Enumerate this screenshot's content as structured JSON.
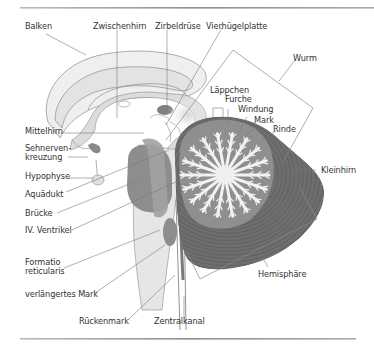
{
  "figure": {
    "type": "anatomical-diagram",
    "colors": {
      "line": "#777777",
      "text": "#333333",
      "rule": "#999999",
      "light_gray": "#e4e4e4",
      "mid_gray": "#c8c8c8",
      "dark_gray": "#8a8a8a",
      "cerebellum_dark": "#6b6b6b",
      "cerebellum_white": "#f0f0f0"
    },
    "labels": {
      "balken": "Balken",
      "zwischenhirn": "Zwischenhirn",
      "zirbeldruese": "Zirbeldrüse",
      "vierhuegelplatte": "Vierhügelplatte",
      "wurm": "Wurm",
      "laeppchen": "Läppchen",
      "furche": "Furche",
      "windung": "Windung",
      "mark_cerebellum": "Mark",
      "rinde": "Rinde",
      "kleinhirn": "Kleinhirn",
      "mittelhirn": "Mittelhirn",
      "sehnervenkreuzung_1": "Sehnerven-",
      "sehnervenkreuzung_2": "kreuzung",
      "hypophyse": "Hypophyse",
      "aquaedukt": "Aquädukt",
      "bruecke": "Brücke",
      "iv_ventrikel": "IV. Ventrikel",
      "formatio_1": "Formatio",
      "formatio_2": "reticularis",
      "verlaengertes_mark": "verlängertes Mark",
      "rueckenmark": "Rückenmark",
      "zentralkanal": "Zentralkanal",
      "hemisphaere": "Hemisphäre"
    }
  }
}
